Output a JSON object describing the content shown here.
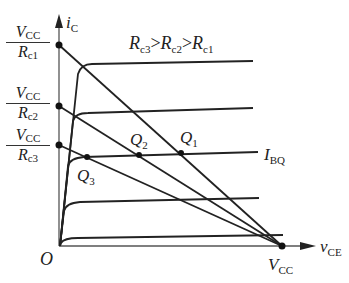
{
  "diagram": {
    "axes": {
      "y_label": "i",
      "y_sub": "C",
      "x_label": "v",
      "x_sub": "CE",
      "origin": "O"
    },
    "y_intercepts": [
      {
        "num": "V",
        "num_sub": "CC",
        "den": "R",
        "den_sub": "c1"
      },
      {
        "num": "V",
        "num_sub": "CC",
        "den": "R",
        "den_sub": "c2"
      },
      {
        "num": "V",
        "num_sub": "CC",
        "den": "R",
        "den_sub": "c3"
      }
    ],
    "x_intercept": {
      "label": "V",
      "sub": "CC"
    },
    "relation": {
      "r3": "R",
      "r3_sub": "c3",
      "gt1": ">",
      "r2": "R",
      "r2_sub": "c2",
      "gt2": ">",
      "r1": "R",
      "r1_sub": "c1"
    },
    "ibq": {
      "label": "I",
      "sub": "BQ"
    },
    "q_points": [
      {
        "label": "Q",
        "sub": "1"
      },
      {
        "label": "Q",
        "sub": "2"
      },
      {
        "label": "Q",
        "sub": "3"
      }
    ],
    "colors": {
      "line": "#222222",
      "axis": "#555555",
      "background": "#ffffff"
    }
  }
}
